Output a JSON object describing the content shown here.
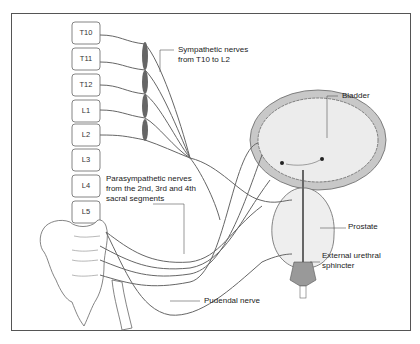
{
  "diagram": {
    "vertebrae": [
      "T10",
      "T11",
      "T12",
      "L1",
      "L2",
      "L3",
      "L4",
      "L5"
    ],
    "labels": {
      "sympathetic_line1": "Sympathetic nerves",
      "sympathetic_line2": "from T10 to L2",
      "bladder": "Bladder",
      "parasympathetic_line1": "Parasympathetic nerves",
      "parasympathetic_line2": "from the 2nd, 3rd and 4th",
      "parasympathetic_line3": "sacral segments",
      "prostate": "Prostate",
      "sphincter_line1": "External urethral",
      "sphincter_line2": "sphincter",
      "pudendal": "Pudendal nerve"
    },
    "colors": {
      "nerve": "#666666",
      "outline": "#555555",
      "bladder_wall": "#c8c8c8",
      "bladder_fill": "#ececec",
      "ganglion": "#666666"
    }
  }
}
